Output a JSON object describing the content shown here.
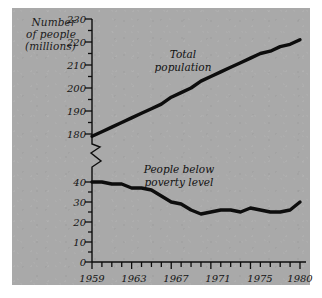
{
  "figure": {
    "background_color": "#a9a9a9",
    "page_color": "#ffffff",
    "line_color": "#0d0d0d"
  },
  "axis_title": {
    "line1": "Number",
    "line2": "of people",
    "line3": "(millions)"
  },
  "y_axis_upper": {
    "ticks": [
      "230",
      "220",
      "210",
      "200",
      "190",
      "180"
    ]
  },
  "y_axis_lower": {
    "ticks": [
      "40",
      "30",
      "20",
      "10",
      "0"
    ]
  },
  "x_axis": {
    "labels": [
      "1959",
      "1963",
      "1967",
      "1971",
      "1975",
      "1980"
    ]
  },
  "labels": {
    "total": {
      "line1": "Total",
      "line2": "population"
    },
    "poverty": {
      "line1": "People below",
      "line2": "poverty level"
    }
  },
  "chart_data": {
    "type": "line",
    "title": "",
    "xlabel": "",
    "ylabel": "Number of people (millions)",
    "grid": false,
    "legend_position": "inline-annotation",
    "axis_note": "broken y-axis: lower segment 0-40, upper segment 180-230",
    "ylim_lower": [
      0,
      40
    ],
    "ylim_upper": [
      180,
      230
    ],
    "xlim": [
      1959,
      1980
    ],
    "x_tick_interval": 1,
    "x_labeled_ticks": [
      1959,
      1963,
      1967,
      1971,
      1975,
      1980
    ],
    "y_tick_interval_major": 10,
    "y_tick_interval_minor": 5,
    "x": [
      1959,
      1960,
      1961,
      1962,
      1963,
      1964,
      1965,
      1966,
      1967,
      1968,
      1969,
      1970,
      1971,
      1972,
      1973,
      1974,
      1975,
      1976,
      1977,
      1978,
      1979,
      1980
    ],
    "series": [
      {
        "name": "Total population",
        "values": [
          179,
          181,
          183,
          185,
          187,
          189,
          191,
          193,
          196,
          198,
          200,
          203,
          205,
          207,
          209,
          211,
          213,
          215,
          216,
          218,
          219,
          221
        ]
      },
      {
        "name": "People below poverty level",
        "values": [
          40,
          40,
          39,
          39,
          37,
          37,
          36,
          33,
          30,
          29,
          26,
          24,
          25,
          26,
          26,
          25,
          27,
          26,
          25,
          25,
          26,
          30
        ]
      }
    ]
  }
}
